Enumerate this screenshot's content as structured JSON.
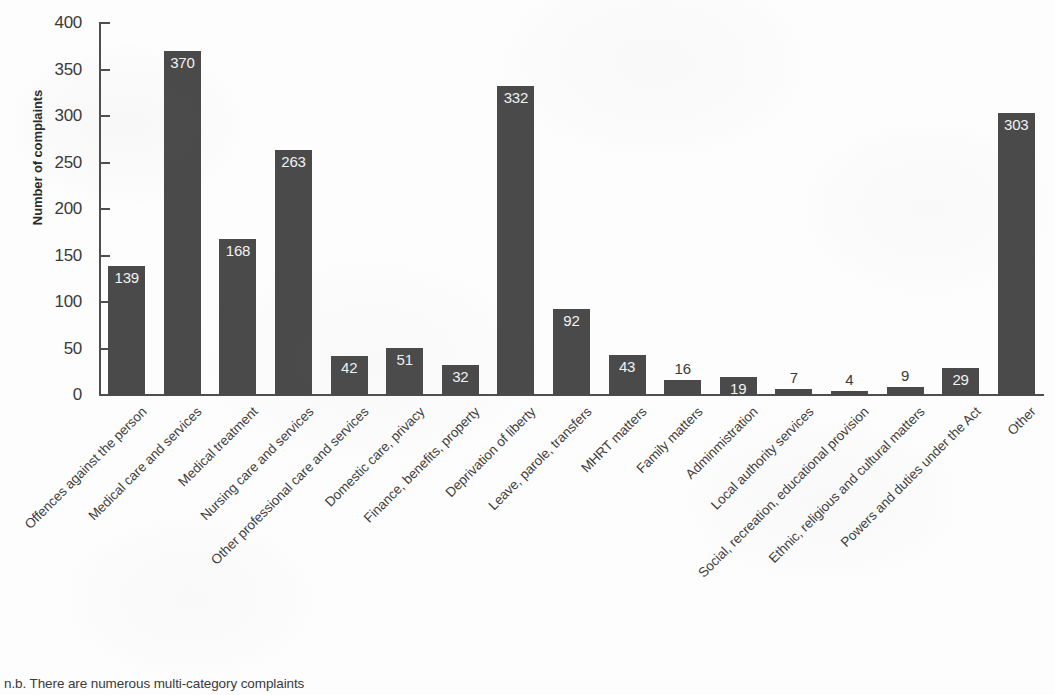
{
  "chart_data": {
    "type": "bar",
    "title": "",
    "xlabel": "",
    "ylabel": "Number of complaints",
    "ylim": [
      0,
      400
    ],
    "ytick_step": 50,
    "yticks": [
      0,
      50,
      100,
      150,
      200,
      250,
      300,
      350,
      400
    ],
    "ytick_labels": [
      "0",
      "50",
      "100",
      "150",
      "200",
      "250",
      "300",
      "350",
      "400"
    ],
    "grid": false,
    "legend": null,
    "categories": [
      "Offences against the person",
      "Medical care and services",
      "Medical treatment",
      "Nursing care and services",
      "Other professional care and services",
      "Domestic care, privacy",
      "Finance, benefits, property",
      "Deprivation of liberty",
      "Leave, parole, transfers",
      "MHRT matters",
      "Family matters",
      "Adminmistration",
      "Local authority services",
      "Social, recreation, educational provision",
      "Ethnic, religious and cultural matters",
      "Powers and duties under the Act",
      "Other"
    ],
    "values": [
      139,
      370,
      168,
      263,
      42,
      51,
      32,
      332,
      92,
      43,
      16,
      19,
      7,
      4,
      9,
      29,
      303
    ],
    "value_labels": [
      "139",
      "370",
      "168",
      "263",
      "42",
      "51",
      "32",
      "332",
      "92",
      "43",
      "16",
      "19",
      "7",
      "4",
      "9",
      "29",
      "303"
    ],
    "label_placement": [
      "inside",
      "inside",
      "inside",
      "inside",
      "inside",
      "inside",
      "inside",
      "inside",
      "inside",
      "inside",
      "outside",
      "inside",
      "outside",
      "outside",
      "outside",
      "inside",
      "inside"
    ],
    "bar_color": "#4a4a4a",
    "inside_label_color": "#f2f2f2",
    "outside_label_color": "#3a3a3a",
    "axis_color": "#4e4e4e",
    "background_color": "#fdfdfd"
  },
  "annotations": {
    "footnote": "n.b. There are numerous multi-category complaints"
  }
}
